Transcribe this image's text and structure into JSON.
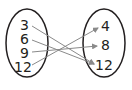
{
  "diagram": {
    "type": "mapping",
    "domain": [
      "3",
      "6",
      "9",
      "12"
    ],
    "range": [
      "4",
      "8",
      "12"
    ],
    "mappings": [
      {
        "from": "3",
        "to": "12"
      },
      {
        "from": "6",
        "to": "12"
      },
      {
        "from": "9",
        "to": "8"
      },
      {
        "from": "12",
        "to": "4"
      }
    ]
  },
  "colors": {
    "ink": "#231f20",
    "arrow": "#8a8a8a"
  }
}
